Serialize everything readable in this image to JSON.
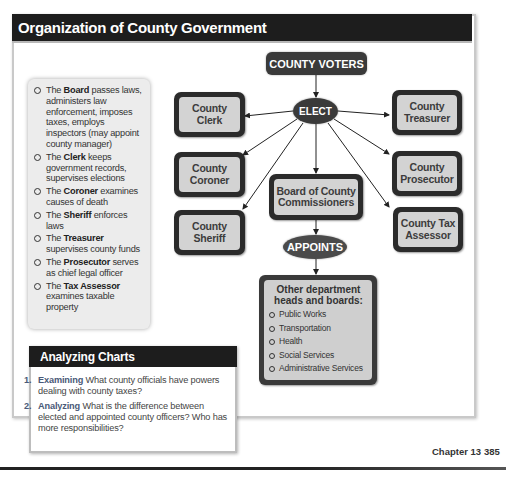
{
  "title": "Organization of County Government",
  "info_panel": {
    "items": [
      {
        "prefix": "The ",
        "term": "Board",
        "text": " passes laws, administers law enforcement, imposes taxes, employs inspectors (may appoint county manager)"
      },
      {
        "prefix": "The ",
        "term": "Clerk",
        "text": " keeps government records, supervises elections"
      },
      {
        "prefix": "The ",
        "term": "Coroner",
        "text": " examines causes of death"
      },
      {
        "prefix": "The ",
        "term": "Sheriff",
        "text": " enforces laws"
      },
      {
        "prefix": "The ",
        "term": "Treasurer",
        "text": " supervises county funds"
      },
      {
        "prefix": "The ",
        "term": "Prosecutor",
        "text": " serves as chief legal officer"
      },
      {
        "prefix": "The ",
        "term": "Tax Assessor",
        "text": " examines taxable property"
      }
    ]
  },
  "diagram": {
    "voters": "COUNTY VOTERS",
    "elect": "ELECT",
    "appoints": "APPOINTS",
    "elected_offices": {
      "clerk": "County Clerk",
      "coroner": "County Coroner",
      "sheriff": "County Sheriff",
      "treasurer": "County Treasurer",
      "prosecutor": "County Prosecutor",
      "tax_assessor": "County Tax Assessor",
      "board": "Board of County Commissioners"
    },
    "appointed": {
      "title": "Other department heads and boards:",
      "items": [
        "Public Works",
        "Transportation",
        "Health",
        "Social Services",
        "Administrative Services"
      ]
    }
  },
  "analyzing": {
    "heading": "Analyzing Charts",
    "questions": [
      {
        "num": "1.",
        "keyword": "Examining",
        "text": "What county officials have powers dealing with county taxes?"
      },
      {
        "num": "2.",
        "keyword": "Analyzing",
        "text": "What is the difference between elected and appointed county officers? Who has more responsibilities?"
      }
    ]
  },
  "footer": {
    "chapter": "Chapter 13",
    "page": "385"
  }
}
